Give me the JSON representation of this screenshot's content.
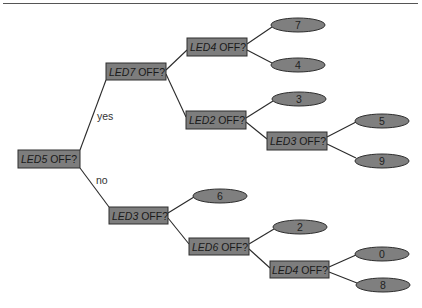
{
  "diagram": {
    "type": "decision-tree",
    "colors": {
      "node_fill": "#7d7d7d",
      "stroke": "#2e2e2e",
      "background": "#ffffff"
    },
    "edge_labels": {
      "yes": "yes",
      "no": "no"
    },
    "nodes": {
      "root": {
        "var": "LED5",
        "q": " OFF?"
      },
      "n_led7": {
        "var": "LED7",
        "q": " OFF?"
      },
      "n_led4a": {
        "var": "LED4",
        "q": " OFF?"
      },
      "n_led2": {
        "var": "LED2",
        "q": " OFF?"
      },
      "n_led3a": {
        "var": "LED3",
        "q": " OFF?"
      },
      "n_led3b": {
        "var": "LED3",
        "q": " OFF?"
      },
      "n_led6": {
        "var": "LED6",
        "q": " OFF?"
      },
      "n_led4b": {
        "var": "LED4",
        "q": " OFF?"
      }
    },
    "leaves": {
      "l7": "7",
      "l4": "4",
      "l3": "3",
      "l5": "5",
      "l9": "9",
      "l6": "6",
      "l2": "2",
      "l0": "0",
      "l8": "8"
    }
  }
}
